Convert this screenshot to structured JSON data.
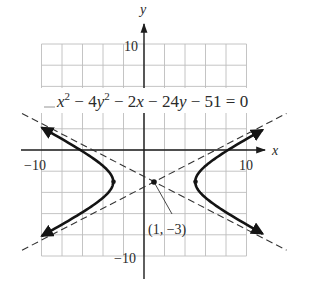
{
  "figure": {
    "equation": {
      "parts": [
        "x",
        "2",
        " − 4",
        "y",
        "2",
        " − 2",
        "x",
        " − 24",
        "y",
        " − 51 = 0"
      ],
      "text": "x² − 4y² − 2x − 24y − 51 = 0"
    },
    "axes": {
      "x_label": "x",
      "y_label": "y",
      "x_tick_labels": {
        "min": "−10",
        "max": "10"
      },
      "y_tick_labels": {
        "min": "−10",
        "max": "10"
      }
    },
    "center_point": {
      "label": "(1, −3)",
      "x": 1,
      "y": -3
    }
  },
  "chart_data": {
    "type": "line",
    "xlabel": "x",
    "ylabel": "y",
    "xlim": [
      -10,
      10
    ],
    "ylim": [
      -10,
      10
    ],
    "grid": true,
    "grid_step": 2,
    "x_ticks_labeled": [
      -10,
      10
    ],
    "y_ticks_labeled": [
      -10,
      10
    ],
    "conic": {
      "kind": "hyperbola",
      "standard_form": "(x − 1)²/16 − (y + 3)²/4 = 1",
      "center": [
        1,
        -3
      ],
      "a": 4,
      "b": 2,
      "vertices": [
        [
          -3,
          -3
        ],
        [
          5,
          -3
        ]
      ],
      "asymptotes": [
        "y + 3 = (1/2)(x − 1)",
        "y + 3 = −(1/2)(x − 1)"
      ]
    },
    "annotations": [
      {
        "text": "(1, −3)",
        "point": [
          1,
          -3
        ]
      },
      {
        "text": "x² − 4y² − 2x − 24y − 51 = 0",
        "position": "upper"
      }
    ],
    "series": [
      {
        "name": "hyperbola (right branch)",
        "style": "solid-bold-arrows"
      },
      {
        "name": "hyperbola (left branch)",
        "style": "solid-bold-arrows"
      },
      {
        "name": "asymptote y = 0.5x − 3.5",
        "style": "dashed"
      },
      {
        "name": "asymptote y = −0.5x − 2.5",
        "style": "dashed"
      }
    ]
  }
}
